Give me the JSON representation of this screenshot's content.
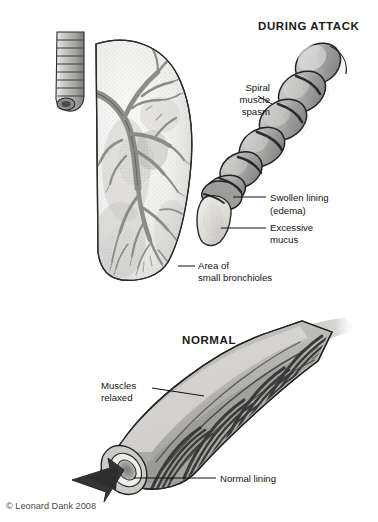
{
  "figure": {
    "title_during_attack": "DURING ATTACK",
    "title_normal": "NORMAL",
    "credit": "© Leonard Dank 2008",
    "background_color": "#ffffff",
    "ink_color": "#111111"
  },
  "panels": {
    "attack": {
      "heading": "DURING ATTACK",
      "labels": {
        "spiral_line1": "Spiral",
        "spiral_line2": "muscle",
        "spiral_line3": "spasm",
        "swollen_line1": "Swollen lining",
        "swollen_line2": "(edema)",
        "mucus_line1": "Excessive",
        "mucus_line2": "mucus"
      }
    },
    "lung": {
      "labels": {
        "bronchioles_line1": "Area of",
        "bronchioles_line2": "small bronchioles"
      }
    },
    "normal": {
      "heading": "NORMAL",
      "labels": {
        "muscles_line1": "Muscles",
        "muscles_line2": "relaxed",
        "lining": "Normal lining"
      }
    }
  },
  "palette": {
    "tissue_mid_gray": "#a9a9a9",
    "tissue_light_gray": "#cfcfcf",
    "tissue_pale": "#e4e2dd",
    "muscle_dark": "#3c3c3c",
    "outline": "#1e1e1e",
    "lung_fill": "#f2f1ef",
    "arrow_fill": "#353535"
  }
}
